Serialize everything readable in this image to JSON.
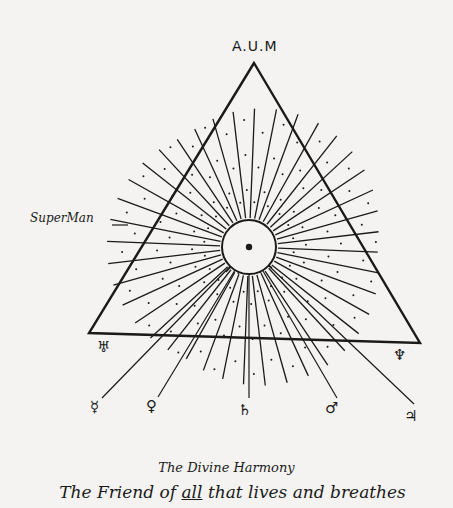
{
  "figure": {
    "apex_label": "A.U.M",
    "side_label": "SuperMan",
    "title": "The Divine Harmony",
    "subtitle_parts": {
      "before": "The Friend of ",
      "underlined": "all",
      "after": " that lives and breathes"
    },
    "colors": {
      "ink": "#1a1a1a",
      "paper": "#f4f3f1"
    },
    "triangle": {
      "apex": [
        254,
        63
      ],
      "bottom_left": [
        89,
        333
      ],
      "bottom_right": [
        420,
        343
      ]
    },
    "center_circle": {
      "cx": 249,
      "cy": 247,
      "r": 27
    },
    "ray_count": 40,
    "corner_symbols": [
      {
        "name": "uranus",
        "glyph": "♅",
        "x": 97,
        "y": 340
      },
      {
        "name": "neptune",
        "glyph": "♆",
        "x": 393,
        "y": 348
      }
    ],
    "bottom_symbols": [
      {
        "name": "mercury",
        "glyph": "☿",
        "x": 90,
        "y": 400
      },
      {
        "name": "venus",
        "glyph": "♀",
        "x": 146,
        "y": 399
      },
      {
        "name": "saturn",
        "glyph": "♄",
        "x": 238,
        "y": 403
      },
      {
        "name": "mars",
        "glyph": "♂",
        "x": 325,
        "y": 401
      },
      {
        "name": "jupiter",
        "glyph": "♃",
        "x": 404,
        "y": 409
      }
    ]
  }
}
